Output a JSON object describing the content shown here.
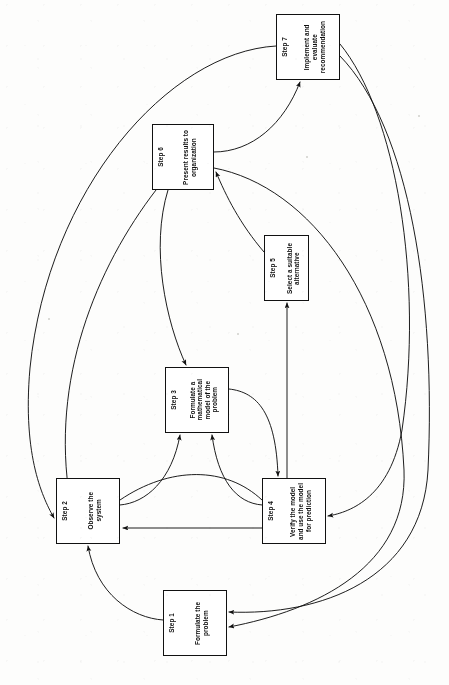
{
  "diagram": {
    "orientation": "rotated-90-ccw",
    "background": "#fdfdfc",
    "stroke_color": "#111111",
    "text_color": "#0d0d0d"
  },
  "nodes": [
    {
      "id": "step1",
      "step_label": "Step 1",
      "body": "Formulate the\nproblem",
      "x": 163,
      "y": 590,
      "w": 64,
      "h": 66
    },
    {
      "id": "step2",
      "step_label": "Step 2",
      "body": "Observe the\nsystem",
      "x": 56,
      "y": 478,
      "w": 64,
      "h": 66
    },
    {
      "id": "step3",
      "step_label": "Step 3",
      "body": "Formulate a\nmathematical\nmodel of the\nproblem",
      "x": 165,
      "y": 367,
      "w": 64,
      "h": 66
    },
    {
      "id": "step4",
      "step_label": "Step 4",
      "body": "Verify the model\nand use the model\nfor prediction",
      "x": 262,
      "y": 478,
      "w": 64,
      "h": 66
    },
    {
      "id": "step5",
      "step_label": "Step 5",
      "body": "Select a suitable\nalternative",
      "x": 264,
      "y": 235,
      "w": 45,
      "h": 66
    },
    {
      "id": "step6",
      "step_label": "Step 6",
      "body": "Present results to\norganization",
      "x": 152,
      "y": 124,
      "w": 62,
      "h": 66
    },
    {
      "id": "step7",
      "step_label": "Step 7",
      "body": "Implement and\nevaluate\nrecommendation",
      "x": 276,
      "y": 14,
      "w": 64,
      "h": 66
    }
  ],
  "edges": [
    {
      "id": "e1-2",
      "from": "step1",
      "to": "step2",
      "kind": "curve"
    },
    {
      "id": "e2-3",
      "from": "step2",
      "to": "step3",
      "kind": "curve"
    },
    {
      "id": "e3-4",
      "from": "step3",
      "to": "step4",
      "kind": "curve"
    },
    {
      "id": "e4-3",
      "from": "step4",
      "to": "step3",
      "kind": "curve"
    },
    {
      "id": "e4-2",
      "from": "step4",
      "to": "step2",
      "kind": "straight"
    },
    {
      "id": "e4-5",
      "from": "step4",
      "to": "step5",
      "kind": "straight"
    },
    {
      "id": "e5-6",
      "from": "step5",
      "to": "step6",
      "kind": "curve"
    },
    {
      "id": "e6-7",
      "from": "step6",
      "to": "step7",
      "kind": "curve"
    },
    {
      "id": "e6-2",
      "from": "step6",
      "to": "step2",
      "kind": "curve"
    },
    {
      "id": "e6-3",
      "from": "step6",
      "to": "step3",
      "kind": "curve"
    },
    {
      "id": "e6-1",
      "from": "step6",
      "to": "step1",
      "kind": "curve"
    },
    {
      "id": "e7-2",
      "from": "step7",
      "to": "step2",
      "kind": "curve"
    },
    {
      "id": "e7-4",
      "from": "step7",
      "to": "step4",
      "kind": "curve"
    },
    {
      "id": "e7-1",
      "from": "step7",
      "to": "step1",
      "kind": "curve"
    },
    {
      "id": "e2-4b",
      "from": "step2",
      "to": "step4",
      "kind": "curve"
    }
  ]
}
